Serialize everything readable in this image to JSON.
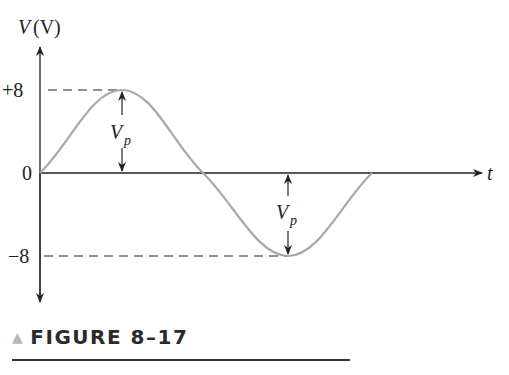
{
  "diagram": {
    "type": "sine-waveform",
    "y_axis_label": "V (V)",
    "y_axis_symbol": "V",
    "y_axis_unit": "(V)",
    "x_axis_label": "t",
    "ticks": {
      "pos": "+8",
      "zero": "0",
      "neg": "−8"
    },
    "peak_label_main": "V",
    "peak_label_sub": "p",
    "peak_value": 8,
    "trough_value": -8,
    "curve_color": "#a8a8a8",
    "axis_color": "#222222"
  },
  "caption": {
    "icon": "triangle-icon",
    "text": "FIGURE 8–17"
  }
}
